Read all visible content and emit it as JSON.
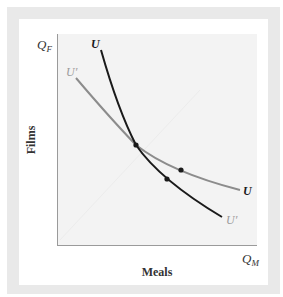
{
  "figure": {
    "y_axis_symbol": "Q",
    "y_axis_subscript": "F",
    "x_axis_symbol": "Q",
    "x_axis_subscript": "M",
    "y_axis_label": "Films",
    "x_axis_label": "Meals"
  },
  "curves": [
    {
      "id": "U",
      "label_top": "U",
      "label_bottom": "U′",
      "color": "#1a1a1a",
      "description": "steeper indifference curve"
    },
    {
      "id": "U_prime",
      "label_top": "U′",
      "label_bottom": "U",
      "color": "#8c8c8c",
      "description": "flatter indifference curve"
    }
  ],
  "points": [
    {
      "name": "intersection-point",
      "on": "both"
    },
    {
      "name": "point-on-gray-curve",
      "on": "gray"
    },
    {
      "name": "point-on-black-curve",
      "on": "black"
    }
  ],
  "colors": {
    "frame": "#e9e9e9",
    "panel": "#ffffff",
    "plot_area": "#f3f3f3",
    "axis": "#9a9a9a",
    "black_curve": "#1a1a1a",
    "gray_curve": "#8c8c8c",
    "label_gray": "#9a9a9a"
  }
}
